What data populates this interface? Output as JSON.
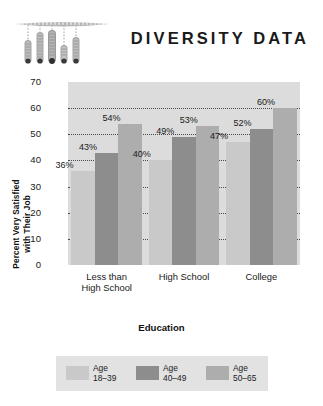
{
  "header": {
    "title": "DIVERSITY DATA",
    "decoration_icon": "hanging-slider-gauges-icon"
  },
  "chart_data": {
    "type": "bar",
    "title": "DIVERSITY DATA",
    "xlabel": "Education",
    "ylabel_line1": "Percent Very Satisfied",
    "ylabel_line2": "with Their Job",
    "categories": [
      "Less than High School",
      "High School",
      "College"
    ],
    "category_lines": [
      [
        "Less than",
        "High School"
      ],
      [
        "High School",
        ""
      ],
      [
        "College",
        ""
      ]
    ],
    "series": [
      {
        "name": "Age 18–39",
        "color": "#c9c9c9",
        "values": [
          36,
          40,
          47
        ]
      },
      {
        "name": "Age 40–49",
        "color": "#8d8d8d",
        "values": [
          43,
          49,
          52
        ]
      },
      {
        "name": "Age 50–65",
        "color": "#adadad",
        "values": [
          54,
          53,
          60
        ]
      }
    ],
    "value_labels": [
      "36%",
      "43%",
      "54%",
      "40%",
      "49%",
      "53%",
      "47%",
      "52%",
      "60%"
    ],
    "ylim": [
      0,
      70
    ],
    "yticks": [
      0,
      10,
      20,
      30,
      40,
      50,
      60,
      70
    ],
    "ytick_labels": [
      "0",
      "10",
      "20",
      "30",
      "40",
      "50",
      "60",
      "70"
    ],
    "grid": true,
    "grid_style": "dotted",
    "plot_background": "#dcdcdc",
    "legend_position": "bottom"
  },
  "legend": {
    "background": "#e2e2e2",
    "items": [
      {
        "label_line1": "Age",
        "label_line2": "18–39",
        "color": "#c9c9c9"
      },
      {
        "label_line1": "Age",
        "label_line2": "40–49",
        "color": "#8d8d8d"
      },
      {
        "label_line1": "Age",
        "label_line2": "50–65",
        "color": "#adadad"
      }
    ]
  }
}
